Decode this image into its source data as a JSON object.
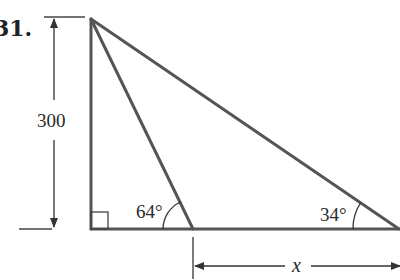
{
  "problem": {
    "number": "31."
  },
  "diagram": {
    "vertical_dimension": {
      "label": "300"
    },
    "angles": {
      "inner": "64°",
      "outer": "34°"
    },
    "horizontal_dimension": {
      "label": "x"
    },
    "right_angle_marker": true,
    "colors": {
      "stroke": "#555555",
      "text": "#2a2a2a"
    }
  }
}
